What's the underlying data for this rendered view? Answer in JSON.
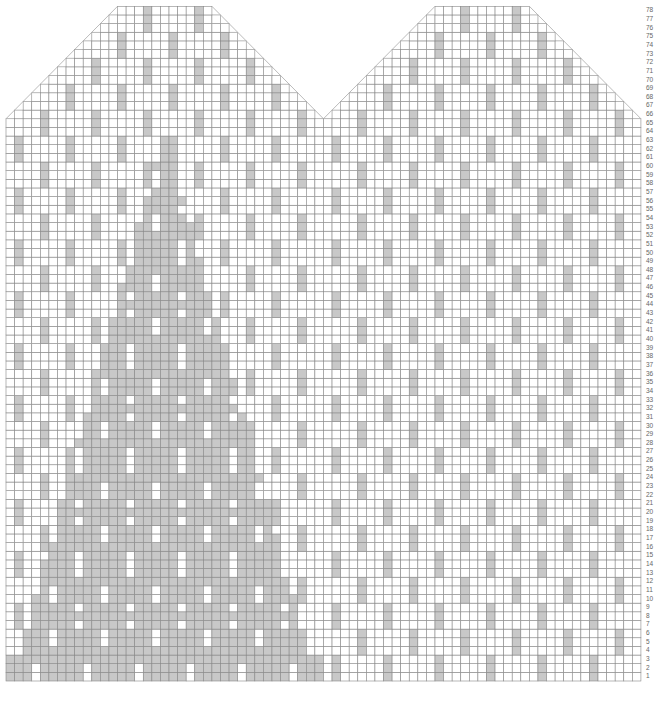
{
  "chart_data": {
    "type": "heatmap",
    "title": "",
    "xlabel": "",
    "ylabel": "Row",
    "rows": 78,
    "columns": 74,
    "row_labels": [
      "1",
      "2",
      "3",
      "4",
      "5",
      "6",
      "7",
      "8",
      "9",
      "10",
      "11",
      "12",
      "13",
      "14",
      "15",
      "16",
      "17",
      "18",
      "19",
      "20",
      "21",
      "22",
      "23",
      "24",
      "25",
      "26",
      "27",
      "28",
      "29",
      "30",
      "31",
      "32",
      "33",
      "34",
      "35",
      "36",
      "37",
      "38",
      "39",
      "40",
      "41",
      "42",
      "43",
      "44",
      "45",
      "46",
      "47",
      "48",
      "49",
      "50",
      "51",
      "52",
      "53",
      "54",
      "55",
      "56",
      "57",
      "58",
      "59",
      "60",
      "61",
      "62",
      "63",
      "64",
      "65",
      "66",
      "67",
      "68",
      "69",
      "70",
      "71",
      "72",
      "73",
      "74",
      "75",
      "76",
      "77",
      "78"
    ],
    "legend": [
      {
        "value": "0",
        "label": "Main color (white)",
        "color": "#ffffff"
      },
      {
        "value": "1",
        "label": "Contrast color (gray)",
        "color": "#c8c8c8"
      }
    ],
    "sections": [
      {
        "name": "left-mitten",
        "start_col": 1,
        "width": 37
      },
      {
        "name": "right-mitten",
        "start_col": 38,
        "width": 37
      }
    ],
    "shaping": {
      "full_width_rows": [
        1,
        65
      ],
      "decrease_start_row": 66,
      "decrease_per_side_per_row": 1,
      "top_row_width": 11
    },
    "grid": true,
    "grid_color": "#888888",
    "cell_width_px": 8.58,
    "cell_height_px": 8.65,
    "origin_px": [
      6,
      681
    ]
  }
}
